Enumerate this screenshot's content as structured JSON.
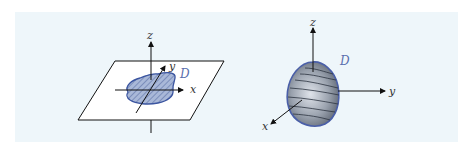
{
  "figure": {
    "background": "#eef6fa",
    "left_panel": {
      "description": "Planar region D in the xy-plane",
      "labels": {
        "z": "z",
        "y": "y",
        "x": "x",
        "region": "D"
      },
      "region_fill": "#8fa4cc",
      "region_stroke": "#3b55a0"
    },
    "right_panel": {
      "description": "Solid region D in 3D space",
      "labels": {
        "z": "z",
        "y": "y",
        "x": "x",
        "region": "D"
      },
      "solid_fill": "#9aa3b0",
      "solid_stroke": "#4a5fa8"
    }
  }
}
